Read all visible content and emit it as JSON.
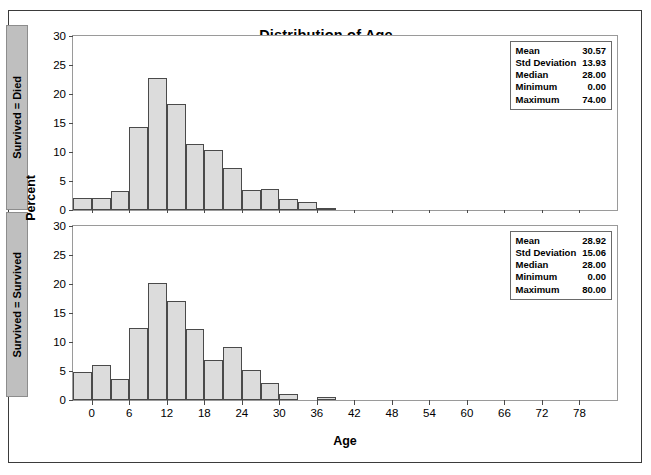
{
  "figure": {
    "title": "Distribution of Age",
    "xlabel": "Age",
    "ylabel": "Percent"
  },
  "panels": [
    {
      "strip_label": "Survived = Died",
      "stats": [
        {
          "key": "Mean",
          "value": "30.57"
        },
        {
          "key": "Std Deviation",
          "value": "13.93"
        },
        {
          "key": "Median",
          "value": "28.00"
        },
        {
          "key": "Minimum",
          "value": "0.00"
        },
        {
          "key": "Maximum",
          "value": "74.00"
        }
      ]
    },
    {
      "strip_label": "Survived = Survived",
      "stats": [
        {
          "key": "Mean",
          "value": "28.92"
        },
        {
          "key": "Std Deviation",
          "value": "15.06"
        },
        {
          "key": "Median",
          "value": "28.00"
        },
        {
          "key": "Minimum",
          "value": "0.00"
        },
        {
          "key": "Maximum",
          "value": "80.00"
        }
      ]
    }
  ],
  "chart_data": {
    "type": "bar",
    "title": "Distribution of Age",
    "xlabel": "Age",
    "ylabel": "Percent",
    "xlim": [
      -3,
      84
    ],
    "ylim": [
      0,
      30
    ],
    "bin_width": 3,
    "grid": false,
    "legend": "none",
    "yticks": [
      0,
      5,
      10,
      15,
      20,
      25,
      30
    ],
    "xticks": [
      0,
      6,
      12,
      18,
      24,
      30,
      36,
      42,
      48,
      54,
      60,
      66,
      72,
      78
    ],
    "panel_layout": "stacked-by-group",
    "series": [
      {
        "name": "Survived = Died",
        "bin_centers": [
          -1.5,
          1.5,
          4.5,
          7.5,
          10.5,
          13.5,
          16.5,
          19.5,
          22.5,
          25.5,
          28.5,
          31.5,
          34.5,
          37.5,
          40.5,
          43.5
        ],
        "bin_starts": [
          -3,
          0,
          3,
          6,
          9,
          12,
          15,
          18,
          21,
          24,
          27,
          30,
          33,
          36,
          39,
          42
        ],
        "values": [
          2.1,
          2.1,
          3.3,
          14.3,
          22.8,
          18.3,
          11.4,
          10.3,
          7.2,
          3.5,
          3.7,
          1.9,
          1.3,
          0.2,
          0.0,
          0.0
        ]
      },
      {
        "name": "Survived = Survived",
        "bin_starts": [
          -3,
          0,
          3,
          6,
          9,
          12,
          15,
          18,
          21,
          24,
          27,
          30,
          33,
          36,
          39,
          42
        ],
        "values": [
          4.9,
          6.0,
          3.6,
          12.4,
          20.1,
          17.0,
          12.3,
          6.9,
          9.2,
          5.2,
          2.9,
          1.1,
          0.0,
          0.6,
          0.0,
          0.0
        ]
      }
    ]
  }
}
